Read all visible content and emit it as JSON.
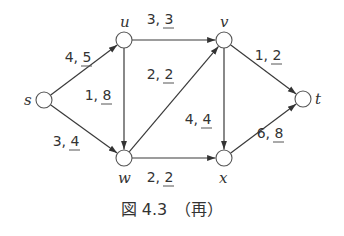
{
  "diagram": {
    "type": "flow-network",
    "nodes": [
      {
        "id": "s",
        "label": "s",
        "x": 44,
        "y": 100
      },
      {
        "id": "u",
        "label": "u",
        "x": 124,
        "y": 40
      },
      {
        "id": "v",
        "label": "v",
        "x": 224,
        "y": 40
      },
      {
        "id": "w",
        "label": "w",
        "x": 124,
        "y": 158
      },
      {
        "id": "x",
        "label": "x",
        "x": 224,
        "y": 158
      },
      {
        "id": "t",
        "label": "t",
        "x": 303,
        "y": 99
      }
    ],
    "edges": [
      {
        "from": "s",
        "to": "u",
        "flow": "4",
        "capacity": "5"
      },
      {
        "from": "s",
        "to": "w",
        "flow": "3",
        "capacity": "4"
      },
      {
        "from": "u",
        "to": "v",
        "flow": "3",
        "capacity": "3"
      },
      {
        "from": "u",
        "to": "w",
        "flow": "1",
        "capacity": "8"
      },
      {
        "from": "w",
        "to": "v",
        "flow": "2",
        "capacity": "2"
      },
      {
        "from": "v",
        "to": "x",
        "flow": "4",
        "capacity": "4"
      },
      {
        "from": "v",
        "to": "t",
        "flow": "1",
        "capacity": "2"
      },
      {
        "from": "w",
        "to": "x",
        "flow": "2",
        "capacity": "2"
      },
      {
        "from": "x",
        "to": "t",
        "flow": "6",
        "capacity": "8"
      }
    ],
    "caption": "図 4.3　（再）"
  }
}
